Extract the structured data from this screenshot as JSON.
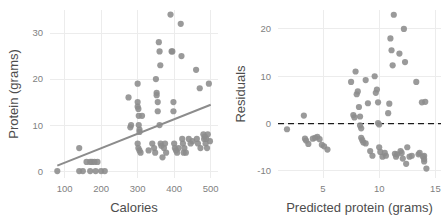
{
  "chart_data": [
    {
      "id": "scatter-protein-vs-calories",
      "type": "scatter",
      "title": "",
      "xlabel": "Calories",
      "ylabel": "Protein (grams)",
      "xlim": [
        60,
        520
      ],
      "ylim": [
        -1.5,
        35
      ],
      "xticks": [
        100,
        200,
        300,
        400,
        500
      ],
      "xtick_labels": [
        "100",
        "200",
        "300",
        "400",
        "500"
      ],
      "yticks": [
        0,
        10,
        20,
        30
      ],
      "ytick_labels": [
        "0",
        "10",
        "20",
        "30"
      ],
      "grid": true,
      "legend": "none",
      "overlay": {
        "type": "line",
        "name": "fitted regression line",
        "color": "#8c8c8c",
        "x": [
          80,
          500
        ],
        "y": [
          1.2,
          14.4
        ]
      },
      "points": [
        [
          80,
          0
        ],
        [
          140,
          0
        ],
        [
          150,
          0
        ],
        [
          170,
          0
        ],
        [
          185,
          0
        ],
        [
          200,
          0
        ],
        [
          210,
          0
        ],
        [
          140,
          5
        ],
        [
          160,
          2
        ],
        [
          170,
          2
        ],
        [
          175,
          2
        ],
        [
          182,
          2
        ],
        [
          190,
          2
        ],
        [
          275,
          16
        ],
        [
          280,
          9.5
        ],
        [
          282,
          10
        ],
        [
          300,
          19
        ],
        [
          300,
          15
        ],
        [
          300,
          14
        ],
        [
          302,
          13.5
        ],
        [
          303,
          12
        ],
        [
          303,
          10
        ],
        [
          305,
          9
        ],
        [
          305,
          8.5
        ],
        [
          300,
          6
        ],
        [
          302,
          5
        ],
        [
          305,
          4.5
        ],
        [
          308,
          4
        ],
        [
          312,
          12
        ],
        [
          330,
          4.5
        ],
        [
          340,
          6
        ],
        [
          345,
          5
        ],
        [
          348,
          4
        ],
        [
          350,
          20
        ],
        [
          352,
          17
        ],
        [
          352,
          16.5
        ],
        [
          355,
          15
        ],
        [
          355,
          13
        ],
        [
          358,
          28
        ],
        [
          360,
          26
        ],
        [
          362,
          23
        ],
        [
          360,
          10
        ],
        [
          363,
          6
        ],
        [
          365,
          5.5
        ],
        [
          368,
          3
        ],
        [
          372,
          5
        ],
        [
          375,
          6
        ],
        [
          378,
          4
        ],
        [
          390,
          34
        ],
        [
          393,
          26
        ],
        [
          395,
          26
        ],
        [
          398,
          15
        ],
        [
          398,
          13
        ],
        [
          400,
          6
        ],
        [
          402,
          5
        ],
        [
          405,
          4.5
        ],
        [
          408,
          4
        ],
        [
          412,
          5
        ],
        [
          418,
          32
        ],
        [
          420,
          25
        ],
        [
          422,
          7
        ],
        [
          424,
          6
        ],
        [
          426,
          4
        ],
        [
          428,
          5
        ],
        [
          432,
          4
        ],
        [
          440,
          7
        ],
        [
          445,
          6
        ],
        [
          450,
          6.5
        ],
        [
          460,
          22
        ],
        [
          462,
          7
        ],
        [
          465,
          6
        ],
        [
          470,
          18
        ],
        [
          472,
          5
        ],
        [
          480,
          8
        ],
        [
          482,
          7
        ],
        [
          484,
          7.5
        ],
        [
          486,
          6
        ],
        [
          488,
          7
        ],
        [
          490,
          5
        ],
        [
          492,
          8
        ],
        [
          495,
          19
        ],
        [
          498,
          6.5
        ]
      ]
    },
    {
      "id": "residuals-vs-predicted",
      "type": "scatter",
      "title": "",
      "xlabel": "Predicted protein (grams)",
      "ylabel": "Residuals",
      "xlim": [
        1,
        15.5
      ],
      "ylim": [
        -11.5,
        24
      ],
      "xticks": [
        5,
        10,
        15
      ],
      "xtick_labels": [
        "5",
        "10",
        "15"
      ],
      "yticks": [
        -10,
        0,
        10,
        20
      ],
      "ytick_labels": [
        "-10",
        "0",
        "10",
        "20"
      ],
      "grid": true,
      "legend": "none",
      "overlay": {
        "type": "hline",
        "name": "zero residual reference line",
        "color": "#1a1a1a",
        "style": "dashed",
        "y": 0
      },
      "points": [
        [
          1.8,
          -1.2
        ],
        [
          3.3,
          1.7
        ],
        [
          3.4,
          -3.2
        ],
        [
          3.5,
          -3.6
        ],
        [
          3.7,
          -4.3
        ],
        [
          4.1,
          -3.2
        ],
        [
          4.3,
          -3.0
        ],
        [
          4.5,
          -2.8
        ],
        [
          4.7,
          -3.3
        ],
        [
          4.9,
          -4.5
        ],
        [
          5.1,
          -4.8
        ],
        [
          5.4,
          -5.5
        ],
        [
          7.5,
          8.8
        ],
        [
          7.7,
          1.8
        ],
        [
          7.8,
          1.3
        ],
        [
          7.9,
          11.0
        ],
        [
          8.0,
          6.2
        ],
        [
          8.1,
          6.8
        ],
        [
          8.2,
          3.5
        ],
        [
          8.3,
          1.5
        ],
        [
          8.3,
          -0.4
        ],
        [
          8.4,
          -1.0
        ],
        [
          8.4,
          -3.0
        ],
        [
          8.5,
          -3.5
        ],
        [
          8.6,
          -4.0
        ],
        [
          8.8,
          -4.2
        ],
        [
          8.8,
          9.2
        ],
        [
          9.0,
          4.3
        ],
        [
          9.2,
          -5.8
        ],
        [
          9.4,
          -6.8
        ],
        [
          9.6,
          10.0
        ],
        [
          9.7,
          6.5
        ],
        [
          9.8,
          7.2
        ],
        [
          9.9,
          4.5
        ],
        [
          9.9,
          0.1
        ],
        [
          10.0,
          -0.2
        ],
        [
          10.0,
          -5.0
        ],
        [
          10.1,
          -6.0
        ],
        [
          10.3,
          -7.0
        ],
        [
          10.5,
          -6.2
        ],
        [
          10.6,
          -6.8
        ],
        [
          10.8,
          2.2
        ],
        [
          10.9,
          4.2
        ],
        [
          11.0,
          18.0
        ],
        [
          11.1,
          15.5
        ],
        [
          11.2,
          12.3
        ],
        [
          11.3,
          23.0
        ],
        [
          11.4,
          -6.4
        ],
        [
          11.5,
          -7.0
        ],
        [
          11.6,
          -6.5
        ],
        [
          11.8,
          14.8
        ],
        [
          11.9,
          -5.8
        ],
        [
          12.0,
          -6.2
        ],
        [
          12.1,
          -7.4
        ],
        [
          12.2,
          20.0
        ],
        [
          12.3,
          13.0
        ],
        [
          12.4,
          -8.5
        ],
        [
          12.5,
          -5.0
        ],
        [
          12.7,
          -7.0
        ],
        [
          12.9,
          -6.8
        ],
        [
          13.3,
          8.8
        ],
        [
          13.5,
          -6.5
        ],
        [
          13.6,
          -6.2
        ],
        [
          13.8,
          4.5
        ],
        [
          13.9,
          -7.0
        ],
        [
          14.0,
          -7.5
        ],
        [
          14.0,
          -6.8
        ],
        [
          14.0,
          -8.0
        ],
        [
          14.1,
          4.6
        ],
        [
          14.2,
          -9.5
        ]
      ]
    }
  ],
  "colors": {
    "point": "#8c8c8c",
    "trendline": "#8c8c8c",
    "zeroline": "#1a1a1a",
    "grid": "#ececec",
    "axis_title": "#4d4d4d",
    "tick_label": "#7f7f7f",
    "background": "#ffffff"
  }
}
